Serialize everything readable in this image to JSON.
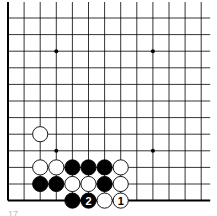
{
  "diagram": {
    "type": "go-board-fragment",
    "grid": {
      "origin_x": 8,
      "origin_y": 18,
      "step_x": 16.1,
      "step_y": 16.6,
      "cols": 13,
      "rows": 12,
      "line_color": "#000000",
      "left_edge": true,
      "bottom_edge": true,
      "right_extension": 9
    },
    "star_points": [
      {
        "col": 3,
        "row": 2
      },
      {
        "col": 9,
        "row": 2
      },
      {
        "col": 3,
        "row": 8
      },
      {
        "col": 9,
        "row": 8
      }
    ],
    "stones": [
      {
        "color": "white",
        "col": 2,
        "row": 7,
        "label": ""
      },
      {
        "color": "white",
        "col": 2,
        "row": 9,
        "label": ""
      },
      {
        "color": "white",
        "col": 3,
        "row": 9,
        "label": ""
      },
      {
        "color": "black",
        "col": 4,
        "row": 9,
        "label": ""
      },
      {
        "color": "black",
        "col": 5,
        "row": 9,
        "label": ""
      },
      {
        "color": "black",
        "col": 6,
        "row": 9,
        "label": ""
      },
      {
        "color": "white",
        "col": 7,
        "row": 9,
        "label": ""
      },
      {
        "color": "black",
        "col": 2,
        "row": 10,
        "label": ""
      },
      {
        "color": "black",
        "col": 3,
        "row": 10,
        "label": ""
      },
      {
        "color": "white",
        "col": 4,
        "row": 10,
        "label": ""
      },
      {
        "color": "white",
        "col": 5,
        "row": 10,
        "label": ""
      },
      {
        "color": "black",
        "col": 6,
        "row": 10,
        "label": ""
      },
      {
        "color": "white",
        "col": 7,
        "row": 10,
        "label": ""
      },
      {
        "color": "black",
        "col": 4,
        "row": 11,
        "label": ""
      },
      {
        "color": "black",
        "col": 5,
        "row": 11,
        "label": "2"
      },
      {
        "color": "white",
        "col": 6,
        "row": 11,
        "label": ""
      },
      {
        "color": "white",
        "col": 7,
        "row": 11,
        "label": "1"
      }
    ],
    "caption": "17"
  }
}
